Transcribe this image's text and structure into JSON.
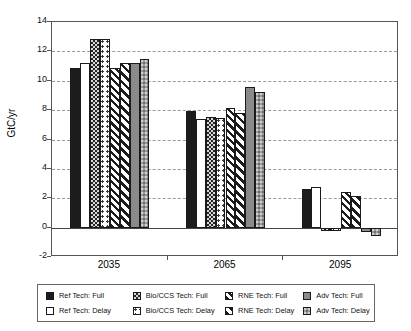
{
  "chart_data": {
    "type": "bar",
    "title": "",
    "subtitle": "",
    "xlabel": "",
    "ylabel": "GtC/yr",
    "categories": [
      "2035",
      "2065",
      "2095"
    ],
    "ylim": [
      -2,
      14
    ],
    "yticks": [
      -2,
      0,
      2,
      4,
      6,
      8,
      10,
      12,
      14
    ],
    "ytick_labels": [
      "-2",
      "0",
      "2",
      "4",
      "6",
      "8",
      "10",
      "12",
      "14"
    ],
    "grid": "horizontal-dashed",
    "legend_position": "bottom",
    "series": [
      {
        "name": "Ref Tech: Full",
        "pattern": "solid-black",
        "values": [
          10.9,
          7.95,
          2.6
        ]
      },
      {
        "name": "Ref Tech: Delay",
        "pattern": "white",
        "values": [
          11.2,
          7.4,
          2.8
        ]
      },
      {
        "name": "Bio/CCS Tech: Full",
        "pattern": "dense-dots",
        "values": [
          12.85,
          7.5,
          -0.25
        ]
      },
      {
        "name": "Bio/CCS Tech: Delay",
        "pattern": "sparse-dots",
        "values": [
          12.85,
          7.45,
          -0.25
        ]
      },
      {
        "name": "RNE Tech: Full",
        "pattern": "hatch-right",
        "values": [
          10.85,
          8.15,
          2.4
        ]
      },
      {
        "name": "RNE Tech: Delay",
        "pattern": "hatch-right2",
        "values": [
          11.2,
          7.8,
          2.15
        ]
      },
      {
        "name": "Adv Tech: Full",
        "pattern": "gray-dark",
        "values": [
          11.2,
          9.55,
          -0.3
        ]
      },
      {
        "name": "Adv Tech: Delay",
        "pattern": "gray-check",
        "values": [
          11.45,
          9.25,
          -0.55
        ]
      }
    ]
  },
  "legend": {
    "rows": [
      [
        {
          "label": "Ref Tech: Full",
          "swatch": "solid-black"
        },
        {
          "label": "Bio/CCS Tech: Full",
          "swatch": "dense-dots"
        },
        {
          "label": "RNE Tech: Full",
          "swatch": "hatch-right"
        },
        {
          "label": "Adv Tech: Full",
          "swatch": "gray-dark"
        }
      ],
      [
        {
          "label": "Ref Tech: Delay",
          "swatch": "white"
        },
        {
          "label": "Bio/CCS Tech: Delay",
          "swatch": "sparse-dots"
        },
        {
          "label": "RNE Tech: Delay",
          "swatch": "hatch-right2"
        },
        {
          "label": "Adv Tech: Delay",
          "swatch": "gray-check"
        }
      ]
    ]
  },
  "colors": {
    "solid_black": "#1c1c1c",
    "white": "#ffffff",
    "gray_dark": "#8a8a8a",
    "gray_light": "#9a9a9a",
    "frame": "#555555",
    "grid": "#999999"
  }
}
